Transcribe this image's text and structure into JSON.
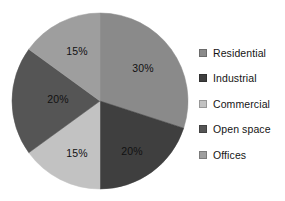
{
  "chart_data": {
    "type": "pie",
    "title": "",
    "categories": [
      "Residential",
      "Industrial",
      "Commercial",
      "Open space",
      "Offices"
    ],
    "values": [
      30,
      20,
      15,
      20,
      15
    ],
    "value_labels": [
      "30%",
      "20%",
      "15%",
      "20%",
      "15%"
    ],
    "unit": "%",
    "start_angle_deg": 0,
    "direction": "clockwise",
    "legend_position": "right",
    "grid": false,
    "colors": [
      "#8a8a8a",
      "#3f3f3f",
      "#c2c2c2",
      "#555555",
      "#9e9e9e"
    ],
    "slices": [
      {
        "name": "Residential",
        "value": 30,
        "label": "30%",
        "color": "#8a8a8a",
        "start_deg": 0,
        "end_deg": 108,
        "label_x": 143,
        "label_y": 69
      },
      {
        "name": "Industrial",
        "value": 20,
        "label": "20%",
        "color": "#3f3f3f",
        "start_deg": 108,
        "end_deg": 180,
        "label_x": 132,
        "label_y": 152
      },
      {
        "name": "Commercial",
        "value": 15,
        "label": "15%",
        "color": "#c2c2c2",
        "start_deg": 180,
        "end_deg": 234,
        "label_x": 77,
        "label_y": 154
      },
      {
        "name": "Open space",
        "value": 20,
        "label": "20%",
        "color": "#555555",
        "start_deg": 234,
        "end_deg": 306,
        "label_x": 58,
        "label_y": 100
      },
      {
        "name": "Offices",
        "value": 15,
        "label": "15%",
        "color": "#9e9e9e",
        "start_deg": 306,
        "end_deg": 360,
        "label_x": 77,
        "label_y": 52
      }
    ],
    "geometry": {
      "center_x": 100,
      "center_y": 101,
      "radius": 88
    }
  },
  "legend": {
    "items": [
      {
        "label": "Residential",
        "color": "#8a8a8a",
        "top": 6
      },
      {
        "label": "Industrial",
        "color": "#3f3f3f",
        "top": 31
      },
      {
        "label": "Commercial",
        "color": "#c2c2c2",
        "top": 57
      },
      {
        "label": "Open space",
        "color": "#555555",
        "top": 82
      },
      {
        "label": "Offices",
        "color": "#9e9e9e",
        "top": 108
      }
    ]
  }
}
